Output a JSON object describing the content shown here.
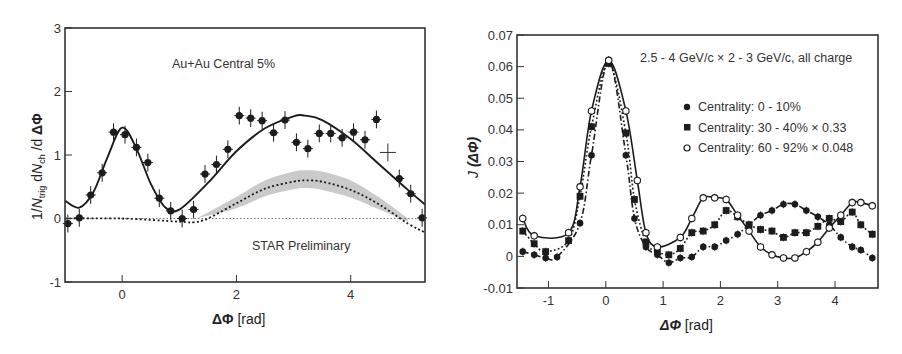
{
  "chart_data": [
    {
      "id": "left",
      "type": "scatter",
      "title": "",
      "annotations": [
        "Au+Au Central 5%",
        "STAR Preliminary"
      ],
      "xlabel": "ΔΦ [rad]",
      "ylabel": "1/N_trig dN_ch /d ΔΦ",
      "xlim": [
        -1.0,
        5.3
      ],
      "ylim": [
        -1,
        3
      ],
      "xticks": [
        0,
        2,
        4
      ],
      "yticks": [
        -1,
        0,
        1,
        2,
        3
      ],
      "grid": false,
      "legend": null,
      "series": [
        {
          "name": "data (error bars)",
          "marker": "filled-circle",
          "x": [
            -0.95,
            -0.75,
            -0.55,
            -0.35,
            -0.15,
            0.05,
            0.25,
            0.45,
            0.65,
            0.85,
            1.05,
            1.25,
            1.45,
            1.65,
            1.85,
            2.05,
            2.25,
            2.45,
            2.65,
            2.85,
            3.05,
            3.25,
            3.45,
            3.65,
            3.85,
            4.05,
            4.25,
            4.45,
            4.85,
            5.05,
            5.25
          ],
          "y": [
            -0.08,
            0.01,
            0.37,
            0.72,
            1.36,
            1.32,
            1.12,
            0.88,
            0.32,
            0.12,
            0.0,
            0.14,
            0.7,
            0.85,
            1.09,
            1.62,
            1.58,
            1.54,
            1.35,
            1.55,
            1.2,
            1.1,
            1.34,
            1.34,
            1.27,
            1.36,
            1.24,
            1.56,
            0.63,
            0.39,
            0.01
          ],
          "yerr": 0.14
        },
        {
          "name": "open cross point",
          "marker": "cross",
          "x": [
            4.65
          ],
          "y": [
            1.04
          ]
        },
        {
          "name": "fit (solid)",
          "style": "solid",
          "x": [
            -1.0,
            -0.75,
            -0.5,
            -0.25,
            0.0,
            0.25,
            0.5,
            0.75,
            1.0,
            1.5,
            2.0,
            2.5,
            3.0,
            3.2,
            3.5,
            4.0,
            4.5,
            5.0,
            5.3
          ],
          "y": [
            0.28,
            0.17,
            0.42,
            0.98,
            1.43,
            1.1,
            0.55,
            0.18,
            0.14,
            0.56,
            1.06,
            1.42,
            1.61,
            1.62,
            1.55,
            1.25,
            0.85,
            0.45,
            0.22
          ]
        },
        {
          "name": "background (dotted)",
          "style": "dotted",
          "x": [
            -1.0,
            0.0,
            1.0,
            1.25,
            1.5,
            2.0,
            2.5,
            3.0,
            3.2,
            3.5,
            4.0,
            4.5,
            5.0,
            5.3
          ],
          "y": [
            0.0,
            0.0,
            -0.05,
            -0.06,
            0.0,
            0.24,
            0.47,
            0.58,
            0.6,
            0.58,
            0.45,
            0.22,
            -0.08,
            -0.22
          ]
        },
        {
          "name": "systematic band (gray)",
          "style": "band",
          "x": [
            1.3,
            2.0,
            2.5,
            3.0,
            3.2,
            3.5,
            4.0,
            4.5,
            5.0
          ],
          "y_low": [
            0.0,
            0.16,
            0.35,
            0.46,
            0.48,
            0.45,
            0.33,
            0.14,
            -0.05
          ],
          "y_high": [
            0.0,
            0.34,
            0.6,
            0.74,
            0.76,
            0.74,
            0.6,
            0.33,
            0.0
          ]
        },
        {
          "name": "zero line",
          "style": "thin-dotted",
          "x": [
            -1.0,
            5.3
          ],
          "y": [
            0,
            0
          ]
        }
      ]
    },
    {
      "id": "right",
      "type": "scatter",
      "title": "2.5 - 4 GeV/c × 2 - 3 GeV/c, all charge",
      "xlabel": "ΔΦ [rad]",
      "ylabel": "J (ΔΦ)",
      "xlim": [
        -1.55,
        4.75
      ],
      "ylim": [
        -0.01,
        0.07
      ],
      "xticks": [
        -1,
        0,
        1,
        2,
        3,
        4
      ],
      "yticks": [
        -0.01,
        0,
        0.01,
        0.02,
        0.03,
        0.04,
        0.05,
        0.06,
        0.07
      ],
      "grid": false,
      "legend_position": "upper right (inside)",
      "series": [
        {
          "name": "Centrality: 0 - 10%",
          "marker": "filled-circle",
          "line": "dash-dot",
          "x": [
            -1.45,
            -1.25,
            -1.05,
            -0.85,
            -0.45,
            -0.25,
            0.05,
            0.35,
            0.5,
            0.7,
            0.9,
            1.1,
            1.3,
            1.5,
            1.7,
            1.9,
            2.1,
            2.3,
            2.5,
            2.7,
            2.9,
            3.1,
            3.3,
            3.5,
            3.7,
            3.9,
            4.1,
            4.3,
            4.45,
            4.65
          ],
          "y": [
            0.0015,
            0.0005,
            -0.0005,
            -0.0002,
            0.0105,
            0.032,
            0.062,
            0.032,
            0.012,
            0.003,
            0.0005,
            -0.002,
            -0.0005,
            -0.0002,
            0.003,
            0.003,
            0.005,
            0.007,
            0.01,
            0.013,
            0.0145,
            0.0165,
            0.0165,
            0.0145,
            0.0125,
            0.01,
            0.006,
            0.003,
            0.002,
            -0.0005
          ]
        },
        {
          "name": "Centrality: 30 - 40% × 0.33",
          "marker": "filled-square",
          "line": "dotted",
          "x": [
            -1.45,
            -1.25,
            -1.05,
            -0.65,
            -0.45,
            -0.25,
            0.05,
            0.35,
            0.5,
            0.7,
            0.9,
            1.1,
            1.3,
            1.5,
            1.7,
            1.9,
            2.1,
            2.3,
            2.5,
            2.7,
            2.9,
            3.1,
            3.3,
            3.5,
            3.7,
            3.9,
            4.1,
            4.3,
            4.45,
            4.65
          ],
          "y": [
            0.008,
            0.004,
            0.0015,
            0.005,
            0.019,
            0.041,
            0.061,
            0.039,
            0.018,
            0.0045,
            0.0015,
            0.0005,
            0.0025,
            0.0075,
            0.008,
            0.01,
            0.0145,
            0.0125,
            0.01,
            0.0085,
            0.008,
            0.006,
            0.0075,
            0.0075,
            0.0095,
            0.012,
            0.011,
            0.014,
            0.01,
            0.007
          ]
        },
        {
          "name": "Centrality: 60 - 92% × 0.048",
          "marker": "open-circle",
          "line": "solid",
          "x": [
            -1.45,
            -1.25,
            -0.65,
            -0.45,
            -0.25,
            0.05,
            0.35,
            0.55,
            0.7,
            0.9,
            1.3,
            1.5,
            1.7,
            1.9,
            2.1,
            2.3,
            2.5,
            2.7,
            2.9,
            3.1,
            3.3,
            3.5,
            3.7,
            3.9,
            4.1,
            4.3,
            4.45,
            4.65
          ],
          "y": [
            0.012,
            0.0065,
            0.0075,
            0.022,
            0.046,
            0.062,
            0.046,
            0.024,
            0.0075,
            0.003,
            0.006,
            0.012,
            0.0185,
            0.0185,
            0.018,
            0.013,
            0.008,
            0.003,
            0.0005,
            -0.0005,
            -0.0005,
            0.0015,
            0.0045,
            0.009,
            0.013,
            0.017,
            0.017,
            0.016
          ]
        }
      ]
    }
  ],
  "left": {
    "annot_top": "Au+Au Central 5%",
    "annot_bottom": "STAR Preliminary",
    "xlabel_sym": "ΔΦ",
    "xlabel_unit": " [rad]",
    "ylabel_1": "1/",
    "ylabel_N": "N",
    "ylabel_trig": "trig",
    "ylabel_d": " d",
    "ylabel_N2": "N",
    "ylabel_ch": "ch",
    "ylabel_tail": " /d ",
    "ylabel_sym": "ΔΦ"
  },
  "right": {
    "title": "2.5 - 4 GeV/c × 2 - 3 GeV/c, all charge",
    "xlabel_sym": "ΔΦ",
    "xlabel_unit": " [rad]",
    "ylabel_J": "J",
    "ylabel_sym": " (ΔΦ)",
    "legend": [
      {
        "marker": "filled-circle",
        "label": "Centrality: 0 - 10%"
      },
      {
        "marker": "filled-square",
        "label": "Centrality: 30 - 40% × 0.33"
      },
      {
        "marker": "open-circle",
        "label": "Centrality: 60 - 92% × 0.048"
      }
    ]
  },
  "colors": {
    "ink": "#1c1c1c",
    "band": "#c4c4c4",
    "axis": "#333333",
    "background": "#ffffff"
  }
}
